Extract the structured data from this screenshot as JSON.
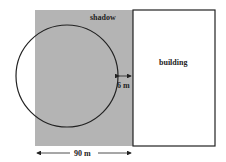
{
  "diagram": {
    "labels": {
      "shadow": "shadow",
      "building": "building",
      "gap": "6 m",
      "width": "90 m"
    },
    "colors": {
      "shadow_fill": "#b4b4b4",
      "stroke": "#222222",
      "building_fill": "#ffffff"
    }
  }
}
